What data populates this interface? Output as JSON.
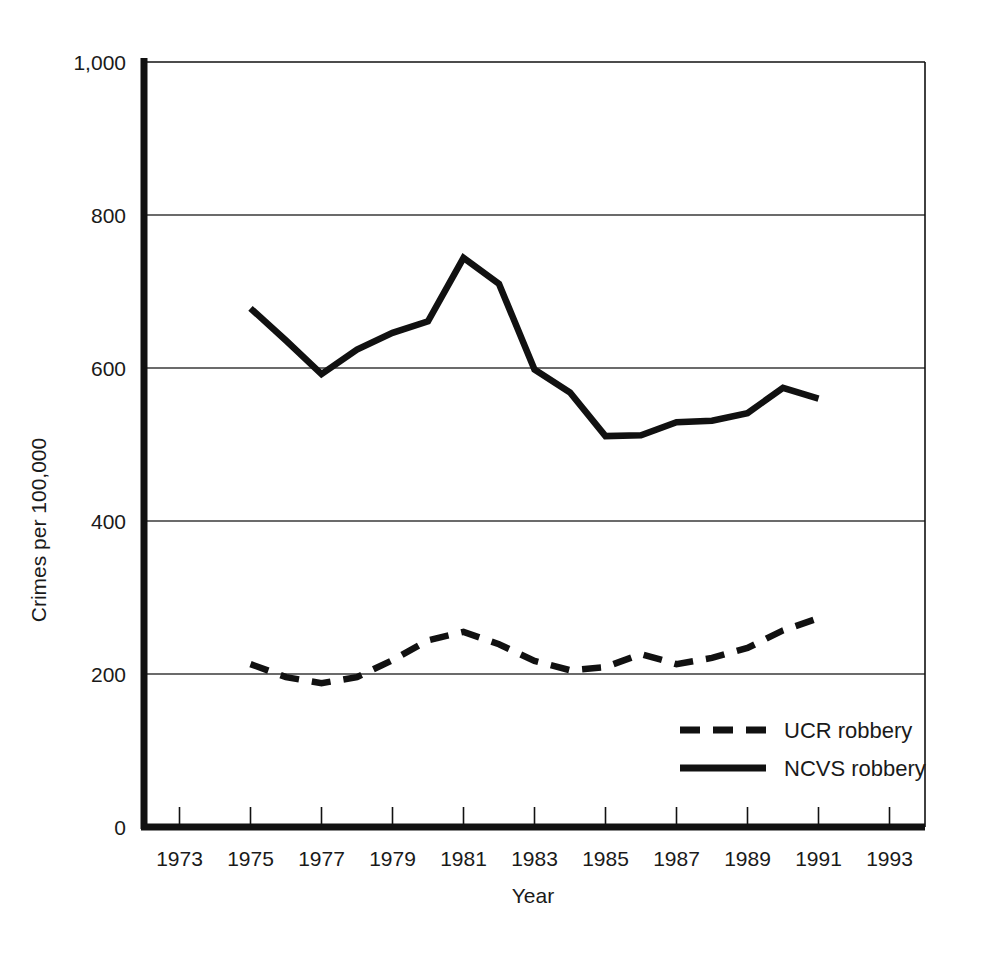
{
  "chart_data": {
    "type": "line",
    "title": "",
    "xlabel": "Year",
    "ylabel": "Crimes per 100,000",
    "xlim": [
      1972,
      1994
    ],
    "ylim": [
      0,
      1000
    ],
    "grid": true,
    "grid_axis": "y",
    "legend_position": "inside-lower-right",
    "x_tick_labels": [
      "1973",
      "1975",
      "1977",
      "1979",
      "1981",
      "1983",
      "1985",
      "1987",
      "1989",
      "1991",
      "1993"
    ],
    "x_ticks": [
      1973,
      1975,
      1977,
      1979,
      1981,
      1983,
      1985,
      1987,
      1989,
      1991,
      1993
    ],
    "y_tick_labels": [
      "0",
      "200",
      "400",
      "600",
      "800",
      "1,000"
    ],
    "y_ticks": [
      0,
      200,
      400,
      600,
      800,
      1000
    ],
    "x": [
      1975,
      1976,
      1977,
      1978,
      1979,
      1980,
      1981,
      1982,
      1983,
      1984,
      1985,
      1986,
      1987,
      1988,
      1989,
      1990,
      1991
    ],
    "series": [
      {
        "name": "UCR robbery",
        "style": "dashed",
        "color": "#111111",
        "values": [
          213,
          196,
          188,
          196,
          218,
          244,
          255,
          239,
          217,
          205,
          209,
          226,
          213,
          221,
          234,
          257,
          273
        ]
      },
      {
        "name": "NCVS robbery",
        "style": "solid",
        "color": "#111111",
        "values": [
          678,
          636,
          592,
          624,
          646,
          661,
          744,
          710,
          598,
          568,
          511,
          512,
          529,
          531,
          541,
          574,
          560
        ]
      }
    ],
    "legend_entries": [
      {
        "label": "UCR robbery",
        "style": "dashed"
      },
      {
        "label": "NCVS robbery",
        "style": "solid"
      }
    ]
  },
  "colors": {
    "ink": "#111111",
    "grid": "#3a3a3a",
    "background": "#ffffff"
  }
}
